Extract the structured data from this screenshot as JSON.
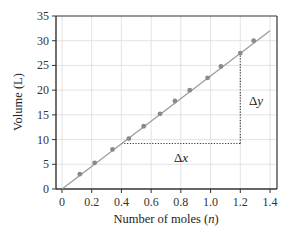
{
  "chart_data": {
    "type": "scatter",
    "title": "",
    "xlabel": "Number of moles (n)",
    "xlabel_main": "Number of moles (",
    "xlabel_var": "n",
    "xlabel_end": ")",
    "ylabel": "Volume (L)",
    "xlim": [
      0,
      1.4
    ],
    "ylim": [
      0,
      35
    ],
    "x_ticks": [
      0,
      0.2,
      0.4,
      0.6,
      0.8,
      1.0,
      1.2,
      1.4
    ],
    "x_tick_labels": [
      "0",
      "0.2",
      "0.4",
      "0.6",
      "0.8",
      "1.0",
      "1.2",
      "1.4"
    ],
    "y_ticks": [
      0,
      5,
      10,
      15,
      20,
      25,
      30,
      35
    ],
    "y_tick_labels": [
      "0",
      "5",
      "10",
      "15",
      "20",
      "25",
      "30",
      "35"
    ],
    "grid": true,
    "series": [
      {
        "name": "Measured volume",
        "type": "scatter",
        "x": [
          0.12,
          0.22,
          0.34,
          0.45,
          0.55,
          0.66,
          0.76,
          0.86,
          0.98,
          1.07,
          1.2,
          1.29
        ],
        "y": [
          3.0,
          5.3,
          8.0,
          10.2,
          12.7,
          15.2,
          17.8,
          20.0,
          22.5,
          24.8,
          27.5,
          30.0
        ],
        "color": "#8a8a8a"
      },
      {
        "name": "Best-fit line",
        "type": "line",
        "x": [
          0,
          1.4
        ],
        "y": [
          0,
          32.0
        ],
        "color": "#9a9a9a"
      }
    ],
    "annotations": [
      {
        "text": "Δx",
        "label_main": "Δ",
        "label_var": "x",
        "type": "horizontal-dotted",
        "from": [
          0.4,
          9.2
        ],
        "to": [
          1.2,
          9.2
        ]
      },
      {
        "text": "Δy",
        "label_main": "Δ",
        "label_var": "y",
        "type": "vertical-dotted",
        "from": [
          1.2,
          9.2
        ],
        "to": [
          1.2,
          27.5
        ]
      }
    ],
    "legend": "none"
  }
}
